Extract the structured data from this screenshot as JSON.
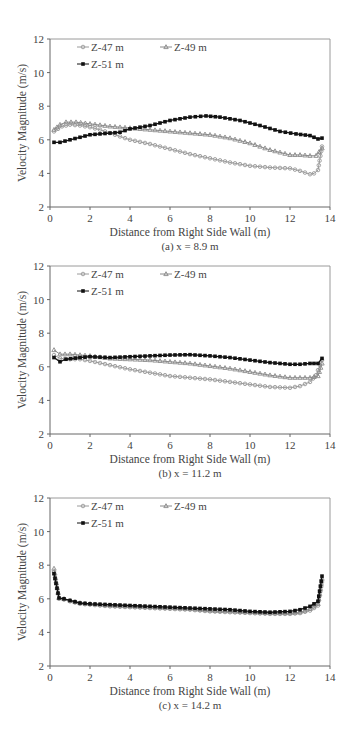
{
  "chart_data": [
    {
      "type": "line",
      "caption": "(a) x = 8.9 m",
      "xlabel": "Distance from Right Side Wall (m)",
      "ylabel": "Velocity Magnitude (m/s)",
      "xlim": [
        0,
        14
      ],
      "ylim": [
        2,
        12
      ],
      "xticks": [
        0,
        2,
        4,
        6,
        8,
        10,
        12,
        14
      ],
      "yticks": [
        2,
        4,
        6,
        8,
        10,
        12
      ],
      "grid": false,
      "legend_position": "upper-left-inside",
      "series": [
        {
          "name": "Z-47 m",
          "marker": "circle",
          "color": "#9a9a9a",
          "x": [
            0.2,
            0.6,
            1.0,
            1.5,
            2.0,
            2.5,
            3.0,
            3.5,
            4.0,
            5.0,
            6.0,
            7.0,
            8.0,
            9.0,
            10.0,
            11.0,
            12.0,
            12.5,
            13.0,
            13.2,
            13.4,
            13.6
          ],
          "y": [
            6.5,
            6.8,
            6.9,
            6.85,
            6.75,
            6.6,
            6.4,
            6.2,
            6.0,
            5.75,
            5.45,
            5.15,
            4.9,
            4.65,
            4.45,
            4.35,
            4.3,
            4.15,
            3.95,
            4.0,
            4.2,
            5.6
          ]
        },
        {
          "name": "Z-49 m",
          "marker": "triangle",
          "color": "#8a8a8a",
          "x": [
            0.2,
            0.5,
            0.8,
            1.3,
            2.0,
            3.0,
            4.0,
            5.0,
            6.0,
            7.0,
            8.0,
            9.0,
            10.0,
            11.0,
            12.0,
            12.5,
            13.0,
            13.3,
            13.6
          ],
          "y": [
            6.6,
            6.9,
            7.05,
            7.05,
            6.95,
            6.8,
            6.7,
            6.6,
            6.5,
            6.4,
            6.3,
            6.1,
            5.8,
            5.4,
            5.1,
            5.1,
            5.05,
            5.05,
            5.5
          ]
        },
        {
          "name": "Z-51 m",
          "marker": "square",
          "color": "#111111",
          "x": [
            0.2,
            0.5,
            1.0,
            2.0,
            3.0,
            3.5,
            4.0,
            5.0,
            6.0,
            7.0,
            7.8,
            8.5,
            9.5,
            10.5,
            11.5,
            12.3,
            13.0,
            13.4,
            13.6
          ],
          "y": [
            5.85,
            5.85,
            6.0,
            6.3,
            6.4,
            6.45,
            6.65,
            6.85,
            7.15,
            7.35,
            7.42,
            7.35,
            7.15,
            6.85,
            6.5,
            6.35,
            6.25,
            6.05,
            6.1
          ]
        }
      ]
    },
    {
      "type": "line",
      "caption": "(b) x = 11.2 m",
      "xlabel": "Distance from Right Side Wall (m)",
      "ylabel": "Velocity Magnitude (m/s)",
      "xlim": [
        0,
        14
      ],
      "ylim": [
        2,
        12
      ],
      "xticks": [
        0,
        2,
        4,
        6,
        8,
        10,
        12,
        14
      ],
      "yticks": [
        2,
        4,
        6,
        8,
        10,
        12
      ],
      "grid": false,
      "legend_position": "upper-left-inside",
      "series": [
        {
          "name": "Z-47 m",
          "marker": "circle",
          "color": "#9a9a9a",
          "x": [
            0.2,
            0.5,
            1.0,
            1.5,
            2.0,
            3.0,
            4.0,
            5.0,
            6.0,
            7.0,
            8.0,
            9.0,
            10.0,
            11.0,
            12.0,
            12.5,
            13.0,
            13.3,
            13.6
          ],
          "y": [
            6.7,
            6.5,
            6.45,
            6.45,
            6.35,
            6.1,
            5.85,
            5.65,
            5.45,
            5.35,
            5.25,
            5.1,
            4.95,
            4.8,
            4.75,
            4.85,
            5.1,
            5.5,
            6.4
          ]
        },
        {
          "name": "Z-49 m",
          "marker": "triangle",
          "color": "#8a8a8a",
          "x": [
            0.2,
            0.5,
            1.0,
            2.0,
            3.0,
            4.0,
            5.0,
            6.0,
            7.0,
            8.0,
            9.0,
            10.0,
            11.0,
            12.0,
            12.5,
            13.0,
            13.4,
            13.6
          ],
          "y": [
            7.0,
            6.75,
            6.75,
            6.65,
            6.5,
            6.45,
            6.4,
            6.3,
            6.2,
            6.05,
            5.9,
            5.7,
            5.5,
            5.35,
            5.35,
            5.35,
            5.45,
            6.2
          ]
        },
        {
          "name": "Z-51 m",
          "marker": "square",
          "color": "#111111",
          "x": [
            0.2,
            0.5,
            0.8,
            1.5,
            2.0,
            3.0,
            4.0,
            5.0,
            6.0,
            7.0,
            8.0,
            9.0,
            10.0,
            11.0,
            12.0,
            12.5,
            13.0,
            13.4,
            13.6
          ],
          "y": [
            6.55,
            6.3,
            6.45,
            6.55,
            6.6,
            6.55,
            6.6,
            6.65,
            6.7,
            6.72,
            6.65,
            6.55,
            6.4,
            6.25,
            6.15,
            6.15,
            6.2,
            6.2,
            6.5
          ]
        }
      ]
    },
    {
      "type": "line",
      "caption": "(c) x = 14.2 m",
      "xlabel": "Distance from Right Side Wall (m)",
      "ylabel": "Velocity Magnitude (m/s)",
      "xlim": [
        0,
        14
      ],
      "ylim": [
        2,
        12
      ],
      "xticks": [
        0,
        2,
        4,
        6,
        8,
        10,
        12,
        14
      ],
      "yticks": [
        2,
        4,
        6,
        8,
        10,
        12
      ],
      "grid": false,
      "legend_position": "upper-left-inside",
      "series": [
        {
          "name": "Z-47 m",
          "marker": "circle",
          "color": "#9a9a9a",
          "x": [
            0.2,
            0.45,
            0.7,
            1.0,
            1.5,
            2.0,
            3.0,
            4.0,
            5.0,
            6.0,
            7.0,
            8.0,
            9.0,
            10.0,
            11.0,
            12.0,
            12.5,
            13.0,
            13.4,
            13.6
          ],
          "y": [
            7.6,
            6.0,
            5.95,
            5.85,
            5.7,
            5.65,
            5.55,
            5.5,
            5.45,
            5.4,
            5.35,
            5.25,
            5.2,
            5.15,
            5.1,
            5.1,
            5.15,
            5.3,
            5.6,
            7.0
          ]
        },
        {
          "name": "Z-49 m",
          "marker": "triangle",
          "color": "#8a8a8a",
          "x": [
            0.2,
            0.45,
            0.7,
            1.0,
            1.5,
            2.0,
            3.0,
            4.0,
            5.0,
            6.0,
            7.0,
            8.0,
            9.0,
            10.0,
            11.0,
            12.0,
            12.5,
            13.0,
            13.4,
            13.6
          ],
          "y": [
            7.8,
            6.05,
            6.0,
            5.9,
            5.75,
            5.7,
            5.6,
            5.55,
            5.5,
            5.45,
            5.4,
            5.3,
            5.25,
            5.2,
            5.15,
            5.15,
            5.2,
            5.4,
            5.7,
            7.2
          ]
        },
        {
          "name": "Z-51 m",
          "marker": "square",
          "color": "#111111",
          "x": [
            0.2,
            0.45,
            0.7,
            1.0,
            1.5,
            2.0,
            3.0,
            4.0,
            5.0,
            6.0,
            7.0,
            8.0,
            9.0,
            10.0,
            11.0,
            12.0,
            12.5,
            13.0,
            13.4,
            13.6
          ],
          "y": [
            7.5,
            6.05,
            6.0,
            5.9,
            5.75,
            5.7,
            5.65,
            5.6,
            5.55,
            5.5,
            5.45,
            5.4,
            5.35,
            5.25,
            5.2,
            5.25,
            5.35,
            5.55,
            5.85,
            7.35
          ]
        }
      ]
    }
  ],
  "layout": {
    "panels": [
      {
        "top": 39,
        "plot_left": 50,
        "plot_right": 330,
        "plot_top": 39,
        "plot_bottom": 207
      },
      {
        "top": 266,
        "plot_left": 50,
        "plot_right": 330,
        "plot_top": 266,
        "plot_bottom": 434
      },
      {
        "top": 498,
        "plot_left": 50,
        "plot_right": 330,
        "plot_top": 498,
        "plot_bottom": 666
      }
    ]
  }
}
